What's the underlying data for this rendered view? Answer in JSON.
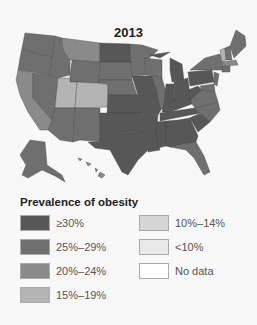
{
  "title": "2013",
  "legend": {
    "title": "Prevalence of obesity",
    "items": [
      {
        "label": "≥30%",
        "color": "#575757"
      },
      {
        "label": "25%–29%",
        "color": "#6f6f6f"
      },
      {
        "label": "20%–24%",
        "color": "#8a8a8a"
      },
      {
        "label": "15%–19%",
        "color": "#b4b4b4"
      },
      {
        "label": "10%–14%",
        "color": "#d6d6d6"
      },
      {
        "label": "<10%",
        "color": "#e9e9e9"
      },
      {
        "label": "No data",
        "color": "#ffffff"
      }
    ]
  },
  "map": {
    "region": "United States",
    "year": "2013",
    "categories": {
      "≥30%": [
        "ND",
        "IA",
        "KS",
        "MO",
        "OK",
        "AR",
        "LA",
        "MS",
        "AL",
        "TN",
        "KY",
        "IN",
        "OH",
        "MI",
        "WV",
        "PA",
        "SC",
        "GA",
        "TX",
        "DE"
      ],
      "25%-29%": [
        "WA",
        "OR",
        "ID",
        "WY",
        "NM",
        "AZ",
        "SD",
        "NE",
        "MN",
        "WI",
        "NV",
        "AK",
        "NC",
        "VA",
        "ME",
        "NH",
        "NY",
        "FL",
        "IL",
        "MD",
        "NJ",
        "CT",
        "RI"
      ],
      "20%-24%": [
        "CA",
        "MT",
        "HI",
        "MA"
      ],
      "15%-19%": [
        "UT",
        "CO",
        "VT"
      ]
    }
  }
}
